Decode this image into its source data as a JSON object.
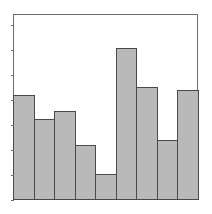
{
  "chart_data": {
    "type": "bar",
    "title": "",
    "xlabel": "",
    "ylabel": "",
    "categories": [
      "1",
      "2",
      "3",
      "4",
      "5",
      "6",
      "7",
      "8",
      "9"
    ],
    "values": [
      4.2,
      3.24,
      3.56,
      2.2,
      1.04,
      6.08,
      4.52,
      2.4,
      4.4
    ],
    "ylim": [
      0,
      7.44
    ],
    "yticks": [
      0,
      1,
      2,
      3,
      4,
      5,
      6,
      7
    ],
    "tick_labels_visible": false,
    "grid": false,
    "legend": null,
    "bar_fill": "#b9b9b9",
    "bar_edge": "#4a4a4a",
    "frame_color": "#6e6e6e",
    "background": "#ffffff"
  },
  "layout": {
    "plot_left": 13,
    "plot_top": 14,
    "plot_width": 185,
    "plot_height": 186
  }
}
